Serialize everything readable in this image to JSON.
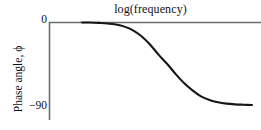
{
  "chart_data": {
    "type": "line",
    "title": "log(frequency)",
    "xlabel": "log(frequency)",
    "ylabel": "Phase angle, ϕ",
    "x_tick_labels": [],
    "y_tick_labels": [
      "0",
      "-90"
    ],
    "y_tick_values": [
      0,
      -90
    ],
    "ylim": [
      -100,
      5
    ],
    "xlim": [
      0,
      10
    ],
    "grid": false,
    "legend": false,
    "legend_position": "none",
    "annotations": [],
    "series": [
      {
        "name": "phase angle",
        "description": "Low-pass phase response: flat at 0 degrees at low frequency, sigmoidal roll-off, asymptotic to -90 degrees at high frequency",
        "x": [
          0.0,
          0.5,
          1.0,
          1.5,
          2.0,
          2.5,
          3.0,
          3.5,
          4.0,
          4.5,
          5.0,
          5.5,
          6.0,
          6.5,
          7.0,
          7.5,
          8.0,
          8.5,
          9.0,
          9.5,
          10.0
        ],
        "values": [
          0,
          0,
          -0.4,
          -1.0,
          -2.2,
          -4.5,
          -8.5,
          -15.0,
          -24.0,
          -35.0,
          -45.0,
          -56.0,
          -66.0,
          -74.0,
          -80.5,
          -84.5,
          -87.0,
          -88.5,
          -89.3,
          -89.7,
          -90.0
        ]
      }
    ],
    "reference_line": {
      "name": "zero-phase-axis",
      "y_value": 0,
      "color": "#6e6e6e"
    },
    "colors": {
      "curve": "#161616",
      "axis": "#6e6e6e",
      "background": "#ffffff",
      "text": "#111111"
    }
  },
  "figure": {
    "title": "log(frequency)",
    "y_axis_label": "Phase angle, ϕ",
    "tick_zero": "0",
    "tick_neg_ninety": "−90"
  }
}
